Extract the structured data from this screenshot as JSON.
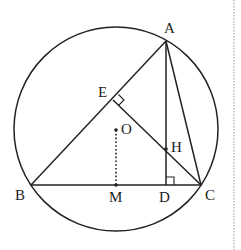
{
  "diagram": {
    "type": "geometry",
    "colors": {
      "stroke": "#222222",
      "background": "#ffffff",
      "divider": "#999999"
    },
    "circle": {
      "center": "O",
      "cx": 116,
      "cy": 129,
      "r": 102
    },
    "points": {
      "A": {
        "label": "A",
        "x": 166,
        "y": 41
      },
      "B": {
        "label": "B",
        "x": 31,
        "y": 185
      },
      "C": {
        "label": "C",
        "x": 201,
        "y": 185
      },
      "D": {
        "label": "D",
        "x": 166,
        "y": 185
      },
      "E": {
        "label": "E",
        "x": 113,
        "y": 100
      },
      "H": {
        "label": "H",
        "x": 166,
        "y": 149
      },
      "M": {
        "label": "M",
        "x": 116,
        "y": 185
      },
      "O": {
        "label": "O",
        "x": 116,
        "y": 130
      }
    },
    "segments": [
      {
        "from": "A",
        "to": "B",
        "style": "solid"
      },
      {
        "from": "A",
        "to": "C",
        "style": "solid"
      },
      {
        "from": "B",
        "to": "C",
        "style": "solid"
      },
      {
        "from": "A",
        "to": "D",
        "style": "solid"
      },
      {
        "from": "C",
        "to": "E",
        "style": "solid"
      },
      {
        "from": "O",
        "to": "M",
        "style": "dotted"
      }
    ],
    "right_angles": [
      "E",
      "D"
    ]
  }
}
